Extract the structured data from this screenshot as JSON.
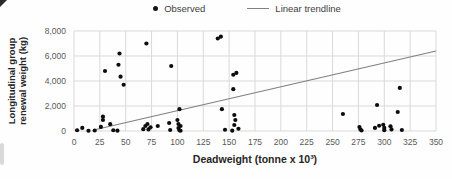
{
  "legend": {
    "observed_label": "Observed",
    "trendline_label": "Linear trendline"
  },
  "axes": {
    "x_title": "Deadweight (tonne x 10³)",
    "y_title_line1": "Longitudinal group",
    "y_title_line2": "renewal weight (kg)"
  },
  "colors": {
    "dot": "#0d0d0d",
    "trendline": "#808080",
    "gridline": "#d9d9d9",
    "tick_text": "#595959",
    "axis_title_text": "#262626",
    "background": "#fefefe"
  },
  "chart_data": {
    "type": "scatter",
    "title": "",
    "xlabel": "Deadweight (tonne x 10³)",
    "ylabel": "Longitudinal group renewal weight (kg)",
    "xlim": [
      0,
      350
    ],
    "ylim": [
      0,
      8000
    ],
    "x_ticks": [
      0,
      25,
      50,
      75,
      100,
      125,
      150,
      175,
      200,
      225,
      250,
      275,
      300,
      325,
      350
    ],
    "y_ticks": [
      0,
      2000,
      4000,
      6000,
      8000
    ],
    "y_tick_labels": [
      "0",
      "2,000",
      "4,000",
      "6,000",
      "8,000"
    ],
    "grid": true,
    "legend_position": "top-center",
    "series": [
      {
        "name": "Observed",
        "type": "scatter",
        "points": [
          [
            3,
            60
          ],
          [
            8,
            250
          ],
          [
            14,
            20
          ],
          [
            20,
            40
          ],
          [
            26,
            330
          ],
          [
            28,
            880
          ],
          [
            28,
            1150
          ],
          [
            30,
            4800
          ],
          [
            35,
            550
          ],
          [
            38,
            60
          ],
          [
            42,
            30
          ],
          [
            43,
            5300
          ],
          [
            44,
            6200
          ],
          [
            45,
            4350
          ],
          [
            48,
            3700
          ],
          [
            67,
            150
          ],
          [
            69,
            400
          ],
          [
            70,
            7000
          ],
          [
            71,
            560
          ],
          [
            72,
            130
          ],
          [
            74,
            300
          ],
          [
            81,
            400
          ],
          [
            92,
            640
          ],
          [
            93,
            80
          ],
          [
            94,
            5200
          ],
          [
            100,
            880
          ],
          [
            101,
            560
          ],
          [
            101,
            240
          ],
          [
            102,
            1750
          ],
          [
            102,
            60
          ],
          [
            103,
            400
          ],
          [
            103,
            20
          ],
          [
            139,
            7400
          ],
          [
            142,
            7550
          ],
          [
            143,
            1750
          ],
          [
            146,
            100
          ],
          [
            153,
            30
          ],
          [
            154,
            3350
          ],
          [
            154,
            4500
          ],
          [
            155,
            1280
          ],
          [
            155,
            480
          ],
          [
            156,
            880
          ],
          [
            157,
            4650
          ],
          [
            159,
            180
          ],
          [
            260,
            1360
          ],
          [
            276,
            320
          ],
          [
            277,
            120
          ],
          [
            278,
            40
          ],
          [
            291,
            250
          ],
          [
            293,
            2080
          ],
          [
            295,
            420
          ],
          [
            299,
            500
          ],
          [
            300,
            250
          ],
          [
            300,
            60
          ],
          [
            306,
            380
          ],
          [
            307,
            130
          ],
          [
            313,
            1520
          ],
          [
            315,
            3450
          ],
          [
            317,
            80
          ]
        ]
      },
      {
        "name": "Linear trendline",
        "type": "line",
        "points": [
          [
            20,
            100
          ],
          [
            350,
            6400
          ]
        ]
      }
    ]
  }
}
